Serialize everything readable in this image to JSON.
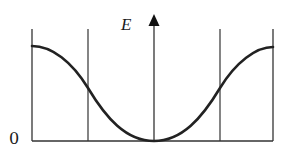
{
  "diagram": {
    "type": "energy band / dispersion sketch",
    "y_axis_label": "E",
    "origin_label": "0",
    "colors": {
      "curve": "#222222",
      "lines": "#333333",
      "background": "#ffffff"
    },
    "geometry": {
      "baseline_y": 141,
      "top_y": 29,
      "left_boundary_x": 32,
      "left_inner_x": 88,
      "axis_x": 154,
      "right_inner_x": 220,
      "right_boundary_x": 273,
      "axis_arrow_tip_y": 15,
      "curve_edge_y": 46,
      "curve_crossing_y": 88
    }
  }
}
